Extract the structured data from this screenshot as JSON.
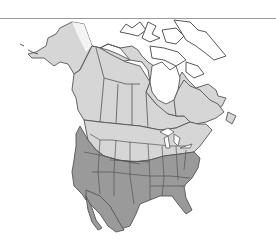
{
  "map": {
    "type": "range-map",
    "region": "North America",
    "legend": [
      {
        "name": "summer-breeding-range",
        "color": "#d6d6d6"
      },
      {
        "name": "year-round-range",
        "color": "#9a9a9a"
      },
      {
        "name": "outside-range",
        "color": "#ffffff"
      }
    ],
    "colors": {
      "light_range": "#d6d6d6",
      "dark_range": "#9a9a9a",
      "border": "#555555",
      "background": "#ffffff",
      "top_rule": "#9a9a9a"
    }
  }
}
